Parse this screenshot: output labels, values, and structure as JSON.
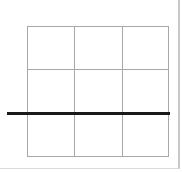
{
  "diagram": {
    "type": "grid",
    "rows": 3,
    "columns": 3,
    "grid_line_color": "#a8a8a8",
    "highlight_line": {
      "orientation": "horizontal",
      "position": "between row 2 and row 3",
      "color": "#1a1a1a"
    }
  }
}
